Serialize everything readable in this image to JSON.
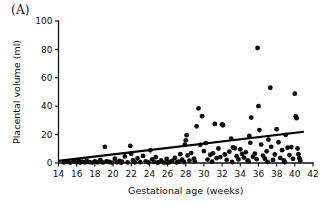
{
  "figure": {
    "panel_label": "(A)"
  },
  "chart_data": {
    "type": "scatter",
    "title": "",
    "xlabel": "Gestational age (weeks)",
    "ylabel": "Placental volume (ml)",
    "xlim": [
      14,
      42
    ],
    "ylim": [
      0,
      100
    ],
    "xticks": [
      14,
      16,
      18,
      20,
      22,
      24,
      26,
      28,
      30,
      32,
      34,
      36,
      38,
      40,
      42
    ],
    "yticks": [
      0,
      20,
      40,
      60,
      80,
      100
    ],
    "xtick_labels": [
      "14",
      "16",
      "18",
      "20",
      "22",
      "24",
      "26",
      "28",
      "30",
      "32",
      "34",
      "36",
      "38",
      "40",
      "42"
    ],
    "ytick_labels": [
      "0",
      "20",
      "40",
      "60",
      "80",
      "100"
    ],
    "grid": false,
    "legend": null,
    "marker": {
      "shape": "circle",
      "color": "#0d0d0d",
      "radius_px": 2.4
    },
    "trend_line": {
      "label": "",
      "color": "#000000",
      "x": [
        14.0,
        41.0
      ],
      "y": [
        1.5,
        22.0
      ]
    },
    "points": [
      [
        14.6,
        0.4
      ],
      [
        15.0,
        0.8
      ],
      [
        15.3,
        0.3
      ],
      [
        15.7,
        1.2
      ],
      [
        16.0,
        0.5
      ],
      [
        16.2,
        2.0
      ],
      [
        16.4,
        0.3
      ],
      [
        16.6,
        1.0
      ],
      [
        16.9,
        0.4
      ],
      [
        17.1,
        1.6
      ],
      [
        17.4,
        0.6
      ],
      [
        17.7,
        0.3
      ],
      [
        18.0,
        1.1
      ],
      [
        18.3,
        0.5
      ],
      [
        18.6,
        2.2
      ],
      [
        18.9,
        0.4
      ],
      [
        19.1,
        11.4
      ],
      [
        19.3,
        1.3
      ],
      [
        19.6,
        0.7
      ],
      [
        19.9,
        0.3
      ],
      [
        20.2,
        3.0
      ],
      [
        20.4,
        0.5
      ],
      [
        20.7,
        1.4
      ],
      [
        21.0,
        0.9
      ],
      [
        21.3,
        4.6
      ],
      [
        21.6,
        0.4
      ],
      [
        21.9,
        12.0
      ],
      [
        22.0,
        6.5
      ],
      [
        22.2,
        1.8
      ],
      [
        22.4,
        0.5
      ],
      [
        22.7,
        3.2
      ],
      [
        23.0,
        0.6
      ],
      [
        23.3,
        5.0
      ],
      [
        23.6,
        1.2
      ],
      [
        23.9,
        0.4
      ],
      [
        24.1,
        8.9
      ],
      [
        24.3,
        2.6
      ],
      [
        24.5,
        0.8
      ],
      [
        24.7,
        4.1
      ],
      [
        25.0,
        0.5
      ],
      [
        25.3,
        1.9
      ],
      [
        25.6,
        0.3
      ],
      [
        25.9,
        2.8
      ],
      [
        26.2,
        0.6
      ],
      [
        26.5,
        1.5
      ],
      [
        26.8,
        3.6
      ],
      [
        27.0,
        0.4
      ],
      [
        27.2,
        1.0
      ],
      [
        27.4,
        6.2
      ],
      [
        27.6,
        2.3
      ],
      [
        27.8,
        0.7
      ],
      [
        27.9,
        13.0
      ],
      [
        28.0,
        16.0
      ],
      [
        28.1,
        19.6
      ],
      [
        28.2,
        5.3
      ],
      [
        28.4,
        1.7
      ],
      [
        28.6,
        7.0
      ],
      [
        28.9,
        3.1
      ],
      [
        29.2,
        25.8
      ],
      [
        29.4,
        38.5
      ],
      [
        29.6,
        12.8
      ],
      [
        29.8,
        33.0
      ],
      [
        30.0,
        8.4
      ],
      [
        30.2,
        14.0
      ],
      [
        30.4,
        2.4
      ],
      [
        30.7,
        5.8
      ],
      [
        31.0,
        6.8
      ],
      [
        31.2,
        27.5
      ],
      [
        31.4,
        3.4
      ],
      [
        31.6,
        10.2
      ],
      [
        31.8,
        4.2
      ],
      [
        32.0,
        27.1
      ],
      [
        32.1,
        26.6
      ],
      [
        32.3,
        6.0
      ],
      [
        32.5,
        2.1
      ],
      [
        32.8,
        8.0
      ],
      [
        33.0,
        17.2
      ],
      [
        33.2,
        11.0
      ],
      [
        33.4,
        10.4
      ],
      [
        33.6,
        4.8
      ],
      [
        33.8,
        2.5
      ],
      [
        34.0,
        9.6
      ],
      [
        34.2,
        6.4
      ],
      [
        34.4,
        3.8
      ],
      [
        34.6,
        7.6
      ],
      [
        34.8,
        1.9
      ],
      [
        35.0,
        19.0
      ],
      [
        35.1,
        14.2
      ],
      [
        35.2,
        32.0
      ],
      [
        35.4,
        4.4
      ],
      [
        35.6,
        6.6
      ],
      [
        35.8,
        2.7
      ],
      [
        35.9,
        81.0
      ],
      [
        36.0,
        40.0
      ],
      [
        36.1,
        23.2
      ],
      [
        36.3,
        13.0
      ],
      [
        36.5,
        5.2
      ],
      [
        36.7,
        3.0
      ],
      [
        36.9,
        8.2
      ],
      [
        37.1,
        16.4
      ],
      [
        37.3,
        53.0
      ],
      [
        37.4,
        11.4
      ],
      [
        37.6,
        2.2
      ],
      [
        37.8,
        6.0
      ],
      [
        38.0,
        23.8
      ],
      [
        38.2,
        14.6
      ],
      [
        38.4,
        3.6
      ],
      [
        38.6,
        9.0
      ],
      [
        38.8,
        1.8
      ],
      [
        39.0,
        19.8
      ],
      [
        39.2,
        10.8
      ],
      [
        39.4,
        5.6
      ],
      [
        39.6,
        11.2
      ],
      [
        39.8,
        2.9
      ],
      [
        40.0,
        48.8
      ],
      [
        40.1,
        32.8
      ],
      [
        40.2,
        31.6
      ],
      [
        40.3,
        10.2
      ],
      [
        40.4,
        6.2
      ],
      [
        40.5,
        3.4
      ],
      [
        40.6,
        1.6
      ],
      [
        29.0,
        1.2
      ],
      [
        30.9,
        0.9
      ],
      [
        33.1,
        0.7
      ],
      [
        34.9,
        1.1
      ],
      [
        37.0,
        0.8
      ],
      [
        38.9,
        0.6
      ],
      [
        26.0,
        0.2
      ],
      [
        24.9,
        0.3
      ],
      [
        20.9,
        0.2
      ]
    ]
  }
}
